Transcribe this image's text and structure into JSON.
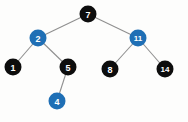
{
  "diagram": {
    "kind": "binary-search-tree",
    "background_color": "#fdfdfc",
    "edge_color": "#8f8f8f",
    "node_colors": {
      "black": "#0d0d0d",
      "blue": "#1f6fb5"
    },
    "label_color": "#ffffff",
    "nodes": [
      {
        "id": "n7",
        "label": "7",
        "color": "black",
        "cx": 88,
        "cy": 14,
        "r": 8.5,
        "font_size": 9
      },
      {
        "id": "n2",
        "label": "2",
        "color": "blue",
        "cx": 38,
        "cy": 38,
        "r": 8.5,
        "font_size": 9
      },
      {
        "id": "n11",
        "label": "11",
        "color": "blue",
        "cx": 138,
        "cy": 38,
        "r": 8.5,
        "font_size": 8
      },
      {
        "id": "n1",
        "label": "1",
        "color": "black",
        "cx": 13,
        "cy": 67,
        "r": 8.5,
        "font_size": 9
      },
      {
        "id": "n5",
        "label": "5",
        "color": "black",
        "cx": 68,
        "cy": 67,
        "r": 8.5,
        "font_size": 9
      },
      {
        "id": "n8",
        "label": "8",
        "color": "black",
        "cx": 110,
        "cy": 69,
        "r": 8.5,
        "font_size": 9
      },
      {
        "id": "n14",
        "label": "14",
        "color": "black",
        "cx": 165,
        "cy": 69,
        "r": 8.5,
        "font_size": 8
      },
      {
        "id": "n4",
        "label": "4",
        "color": "blue",
        "cx": 57,
        "cy": 101,
        "r": 8.5,
        "font_size": 9
      }
    ],
    "edges": [
      {
        "id": "e7-2",
        "from": "n7",
        "to": "n2",
        "x1": 88,
        "y1": 14,
        "x2": 38,
        "y2": 38
      },
      {
        "id": "e7-11",
        "from": "n7",
        "to": "n11",
        "x1": 88,
        "y1": 14,
        "x2": 138,
        "y2": 38
      },
      {
        "id": "e2-1",
        "from": "n2",
        "to": "n1",
        "x1": 38,
        "y1": 38,
        "x2": 13,
        "y2": 67
      },
      {
        "id": "e2-5",
        "from": "n2",
        "to": "n5",
        "x1": 38,
        "y1": 38,
        "x2": 68,
        "y2": 67
      },
      {
        "id": "e11-8",
        "from": "n11",
        "to": "n8",
        "x1": 138,
        "y1": 38,
        "x2": 110,
        "y2": 69
      },
      {
        "id": "e11-14",
        "from": "n11",
        "to": "n14",
        "x1": 138,
        "y1": 38,
        "x2": 165,
        "y2": 69
      },
      {
        "id": "e5-4",
        "from": "n5",
        "to": "n4",
        "x1": 68,
        "y1": 67,
        "x2": 57,
        "y2": 101
      }
    ]
  }
}
